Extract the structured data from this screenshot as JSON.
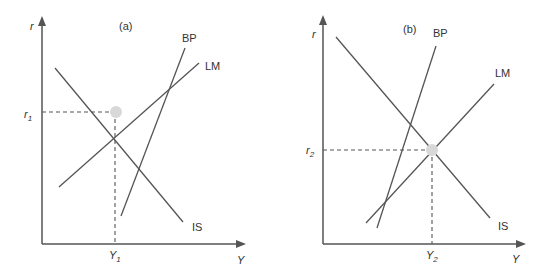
{
  "colors": {
    "line": "#555555",
    "text": "#333333",
    "equilibrium_dot": "#d8d8d8",
    "background": "#ffffff"
  },
  "panels": [
    {
      "label": "(a)",
      "y_axis_label": "r",
      "x_axis_label": "Y",
      "eq_r_label": "r",
      "eq_r_sub": "1",
      "eq_y_label": "Y",
      "eq_y_sub": "1",
      "curves": {
        "bp": "BP",
        "lm": "LM",
        "is": "IS"
      }
    },
    {
      "label": "(b)",
      "y_axis_label": "r",
      "x_axis_label": "Y",
      "eq_r_label": "r",
      "eq_r_sub": "2",
      "eq_y_label": "Y",
      "eq_y_sub": "2",
      "curves": {
        "bp": "BP",
        "lm": "LM",
        "is": "IS"
      }
    }
  ]
}
